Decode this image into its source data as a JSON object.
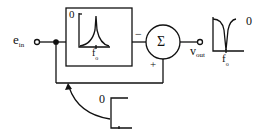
{
  "diagram": {
    "title": "",
    "input": {
      "symbol": "e",
      "subscript": "in"
    },
    "output": {
      "symbol": "v",
      "subscript": "out"
    },
    "filter_block": {
      "response_type": "bandpass",
      "y_label": "0",
      "x_label": "f",
      "x_label_subscript": "o"
    },
    "summer": {
      "symbol": "Σ",
      "minus_sign": "−",
      "plus_sign": "+"
    },
    "output_response": {
      "response_type": "notch",
      "y_label": "0",
      "x_label": "f",
      "x_label_subscript": "o"
    },
    "feedback_gain_graph": {
      "y_label": "0"
    },
    "colors": {
      "line": "#111111",
      "background": "#ffffff"
    }
  }
}
